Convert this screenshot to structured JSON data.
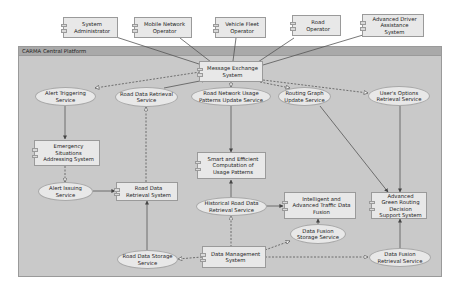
{
  "diagram": {
    "frame": {
      "title": "CARMA Central Platform"
    },
    "colors": {
      "background": "#ffffff",
      "frame_fill": "#c9c9c9",
      "frame_header": "#a9a9a9",
      "node_fill": "#e8e8e8",
      "border": "#9a9a9a",
      "line": "#555555"
    },
    "actors": [
      {
        "id": "system-administrator",
        "label": "System Administrator"
      },
      {
        "id": "mobile-network-operator",
        "label": "Mobile Network Operator"
      },
      {
        "id": "vehicle-fleet-operator",
        "label": "Vehicle Fleet Operator"
      },
      {
        "id": "road-operator",
        "label": "Road Operator"
      },
      {
        "id": "adas",
        "label": "Advanced Driver Assistance System"
      }
    ],
    "components": {
      "message_exchange": "Message Exchange System",
      "emergency": "Emergency Situations Addressing System",
      "smart_computation": "Smart and Efficient Computation of Usage Patterns",
      "road_data_retrieval_system": "Road Data Retrieval System",
      "traffic_fusion": "Intelligent and Advanced Traffic Data Fusion",
      "green_routing": "Advanced Green Routing Decision Support System",
      "data_management": "Data Management System"
    },
    "services": {
      "alert_triggering": "Alert Triggering Service",
      "road_data_retrieval_service": "Road Data Retrieval Service",
      "usage_patterns_update": "Road Network Usage Patterns Update Service",
      "routing_graph_update": "Routing Graph Update Service",
      "user_options_retrieval": "User's Options Retrieval Service",
      "alert_issuing": "Alert Issuing Service",
      "historical_road_data": "Historical Road Data Retrieval Service",
      "data_fusion_storage": "Data Fusion Storage Service",
      "road_data_storage": "Road Data Storage Service",
      "data_fusion_retrieval": "Data Fusion Retrieval Service"
    },
    "connections": [
      {
        "from": "System Administrator",
        "to": "Message Exchange System",
        "style": "solid"
      },
      {
        "from": "Mobile Network Operator",
        "to": "Message Exchange System",
        "style": "solid"
      },
      {
        "from": "Vehicle Fleet Operator",
        "to": "Message Exchange System",
        "style": "solid"
      },
      {
        "from": "Road Operator",
        "to": "Message Exchange System",
        "style": "solid"
      },
      {
        "from": "Advanced Driver Assistance System",
        "to": "Message Exchange System",
        "style": "solid"
      },
      {
        "from": "Message Exchange System",
        "to": "Alert Triggering Service",
        "style": "dashed"
      },
      {
        "from": "Road Data Retrieval Service",
        "to": "Message Exchange System",
        "style": "solid"
      },
      {
        "from": "Message Exchange System",
        "to": "Road Network Usage Patterns Update Service",
        "style": "dashed"
      },
      {
        "from": "Message Exchange System",
        "to": "Routing Graph Update Service",
        "style": "dashed"
      },
      {
        "from": "Message Exchange System",
        "to": "User's Options Retrieval Service",
        "style": "dashed"
      },
      {
        "from": "Alert Triggering Service",
        "to": "Emergency Situations Addressing System",
        "style": "solid"
      },
      {
        "from": "Emergency Situations Addressing System",
        "to": "Alert Issuing Service",
        "style": "dashed"
      },
      {
        "from": "Alert Issuing Service",
        "to": "Road Data Retrieval System",
        "style": "solid"
      },
      {
        "from": "Road Data Retrieval System",
        "to": "Road Data Retrieval Service",
        "style": "dashed"
      },
      {
        "from": "Road Data Storage Service",
        "to": "Road Data Retrieval System",
        "style": "solid"
      },
      {
        "from": "Road Network Usage Patterns Update Service",
        "to": "Smart and Efficient Computation of Usage Patterns",
        "style": "solid"
      },
      {
        "from": "Historical Road Data Retrieval Service",
        "to": "Smart and Efficient Computation of Usage Patterns",
        "style": "solid"
      },
      {
        "from": "Historical Road Data Retrieval Service",
        "to": "Intelligent and Advanced Traffic Data Fusion",
        "style": "solid"
      },
      {
        "from": "Data Management System",
        "to": "Historical Road Data Retrieval Service",
        "style": "dashed"
      },
      {
        "from": "Data Management System",
        "to": "Road Data Storage Service",
        "style": "dashed"
      },
      {
        "from": "Data Management System",
        "to": "Data Fusion Storage Service",
        "style": "dashed"
      },
      {
        "from": "Data Management System",
        "to": "Data Fusion Retrieval Service",
        "style": "dashed"
      },
      {
        "from": "Data Fusion Storage Service",
        "to": "Intelligent and Advanced Traffic Data Fusion",
        "style": "solid"
      },
      {
        "from": "Routing Graph Update Service",
        "to": "Advanced Green Routing Decision Support System",
        "style": "solid"
      },
      {
        "from": "User's Options Retrieval Service",
        "to": "Advanced Green Routing Decision Support System",
        "style": "solid"
      },
      {
        "from": "Data Fusion Retrieval Service",
        "to": "Advanced Green Routing Decision Support System",
        "style": "solid"
      }
    ]
  }
}
